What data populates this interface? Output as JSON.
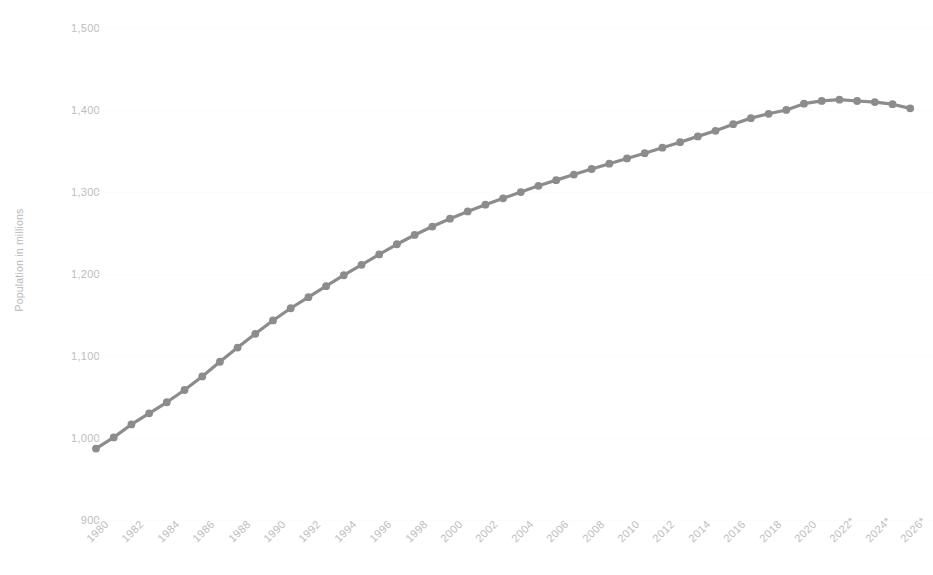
{
  "chart_data": {
    "type": "line",
    "title": "",
    "subtitle": "",
    "xlabel": "",
    "ylabel": "Population in millions",
    "ylim": [
      900,
      1500
    ],
    "y_ticks": [
      "900",
      "1,000",
      "1,100",
      "1,200",
      "1,300",
      "1,400",
      "1,500"
    ],
    "y_tick_values": [
      900,
      1000,
      1100,
      1200,
      1300,
      1400,
      1500
    ],
    "x_tick_labels": [
      "1980",
      "1982",
      "1984",
      "1986",
      "1988",
      "1990",
      "1992",
      "1994",
      "1996",
      "1998",
      "2000",
      "2002",
      "2004",
      "2006",
      "2008",
      "2010",
      "2012",
      "2014",
      "2016",
      "2018",
      "2020",
      "2022*",
      "2024*",
      "2026*"
    ],
    "grid": true,
    "legend": "none",
    "series_color": "#8c8c8c",
    "marker": "circle",
    "x": [
      1980,
      1981,
      1982,
      1983,
      1984,
      1985,
      1986,
      1987,
      1988,
      1989,
      1990,
      1991,
      1992,
      1993,
      1994,
      1995,
      1996,
      1997,
      1998,
      1999,
      2000,
      2001,
      2002,
      2003,
      2004,
      2005,
      2006,
      2007,
      2008,
      2009,
      2010,
      2011,
      2012,
      2013,
      2014,
      2015,
      2016,
      2017,
      2018,
      2019,
      2020,
      2021,
      2022,
      2023,
      2024,
      2025,
      2026
    ],
    "values": [
      987.05,
      1000.72,
      1016.54,
      1030.08,
      1043.57,
      1058.51,
      1075.07,
      1093.0,
      1110.26,
      1127.04,
      1143.33,
      1158.23,
      1171.71,
      1185.17,
      1198.5,
      1211.21,
      1223.89,
      1236.26,
      1247.61,
      1257.86,
      1267.43,
      1276.27,
      1284.53,
      1292.27,
      1299.88,
      1307.56,
      1314.48,
      1321.29,
      1328.02,
      1334.5,
      1340.91,
      1347.35,
      1354.04,
      1360.72,
      1367.82,
      1374.62,
      1382.71,
      1390.08,
      1395.38,
      1400.05,
      1407.75,
      1411.1,
      1412.6,
      1411.0,
      1409.67,
      1407.07,
      1402.0
    ],
    "annotations": [
      "* indicates projected values"
    ]
  }
}
